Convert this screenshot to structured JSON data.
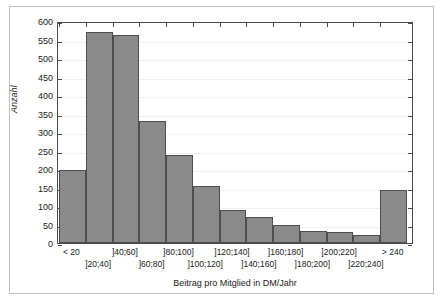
{
  "chart_data": {
    "type": "bar",
    "title": "",
    "xlabel": "Beitrag pro Mitglied in DM/Jahr",
    "ylabel": "Anzahl",
    "categories": [
      "< 20",
      "]20;40]",
      "]40;60]",
      "]60;80]",
      "]80;100]",
      "]100;120]",
      "]120;140]",
      "]140;160]",
      "]160;180]",
      "]180;200]",
      "]200;220]",
      "]220;240]",
      "> 240"
    ],
    "values": [
      196,
      570,
      563,
      330,
      237,
      155,
      90,
      70,
      49,
      32,
      30,
      22,
      144
    ],
    "ylim": [
      0,
      600
    ],
    "ytick_labels": [
      "0",
      "50",
      "100",
      "150",
      "200",
      "250",
      "300",
      "350",
      "400",
      "450",
      "500",
      "550",
      "600"
    ],
    "ytick_values": [
      0,
      50,
      100,
      150,
      200,
      250,
      300,
      350,
      400,
      450,
      500,
      550,
      600
    ],
    "grid": true,
    "legend": false,
    "bar_color": "#8a8a8a",
    "bar_edge_color": "#4e4e4e",
    "axis_color": "#4a4a4a",
    "grid_color": "#f0f0f0",
    "frame_color": "#bfbfbf",
    "background": "#ffffff"
  }
}
